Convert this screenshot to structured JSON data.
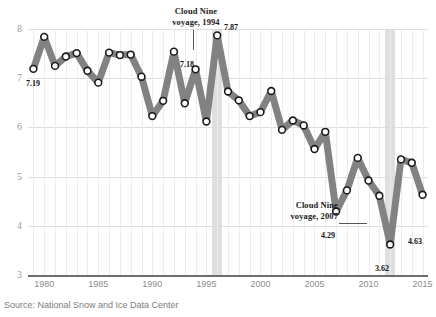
{
  "chart_data": {
    "type": "line",
    "title": "",
    "subtitle": "",
    "xlabel": "",
    "ylabel": "",
    "xlim": [
      1978.5,
      2015.5
    ],
    "ylim": [
      3,
      8
    ],
    "grid": true,
    "legend_position": "none",
    "x_ticks": [
      "1980",
      "1985",
      "1990",
      "1995",
      "2000",
      "2005",
      "2010",
      "2015"
    ],
    "y_ticks": [
      "3",
      "4",
      "5",
      "6",
      "7",
      "8"
    ],
    "series": [
      {
        "name": "Arctic sea ice extent",
        "x": [
          1979,
          1980,
          1981,
          1982,
          1983,
          1984,
          1985,
          1986,
          1987,
          1988,
          1989,
          1990,
          1991,
          1992,
          1993,
          1994,
          1995,
          1996,
          1997,
          1998,
          1999,
          2000,
          2001,
          2002,
          2003,
          2004,
          2005,
          2006,
          2007,
          2008,
          2009,
          2010,
          2011,
          2012,
          2013,
          2014,
          2015
        ],
        "values": [
          7.19,
          7.84,
          7.25,
          7.44,
          7.51,
          7.15,
          6.91,
          7.52,
          7.47,
          7.48,
          7.03,
          6.23,
          6.54,
          7.54,
          6.49,
          7.18,
          6.12,
          7.87,
          6.73,
          6.55,
          6.23,
          6.31,
          6.74,
          5.95,
          6.14,
          6.04,
          5.56,
          5.91,
          4.29,
          4.72,
          5.38,
          4.92,
          4.61,
          3.62,
          5.35,
          5.28,
          4.63
        ]
      }
    ],
    "point_labels": [
      {
        "year": 1979,
        "value": "7.19"
      },
      {
        "year": 1994,
        "value": "7.18"
      },
      {
        "year": 1996,
        "value": "7.87"
      },
      {
        "year": 2007,
        "value": "4.29"
      },
      {
        "year": 2012,
        "value": "3.62"
      },
      {
        "year": 2015,
        "value": "4.63"
      }
    ],
    "annotations": [
      {
        "id": "cloud-nine-1994",
        "line1": "Cloud Nine",
        "line2": "voyage, 1994",
        "target_year": 1994
      },
      {
        "id": "cloud-nine-2007",
        "line1": "Cloud Nine",
        "line2": "voyage, 2007",
        "target_year": 2007
      }
    ],
    "highlight_bands": [
      {
        "year": 1996,
        "color": "#d9d9d9"
      },
      {
        "year": 2012,
        "color": "#d9d9d9"
      }
    ],
    "colors": {
      "line": "#828282",
      "marker_fill": "#ffffff",
      "marker_stroke": "#1a1a1a",
      "grid": "#dedede",
      "axis": "#6d6d6d",
      "band": "#d9d9d9",
      "tick_text": "#9a9a9a",
      "label_text": "#111111"
    }
  },
  "footer": {
    "source": "Source: National Snow and Ice Data Center"
  },
  "top_trim": {
    "text": ""
  }
}
